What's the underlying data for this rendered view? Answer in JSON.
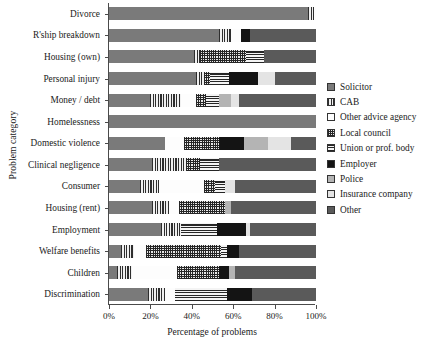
{
  "chart_data": {
    "type": "bar",
    "orientation": "horizontal",
    "stacked": true,
    "normalized": true,
    "title": "",
    "xlabel": "Percentage of problems",
    "ylabel": "Problem category",
    "xlim": [
      0,
      100
    ],
    "xticks": [
      "0%",
      "20%",
      "40%",
      "60%",
      "80%",
      "100%"
    ],
    "xtick_values": [
      0,
      20,
      40,
      60,
      80,
      100
    ],
    "grid": false,
    "legend_position": "right",
    "categories": [
      "Divorce",
      "R'ship breakdown",
      "Housing (own)",
      "Personal injury",
      "Money / debt",
      "Homelessness",
      "Domestic violence",
      "Clinical negligence",
      "Consumer",
      "Housing (rent)",
      "Employment",
      "Welfare benefits",
      "Children",
      "Discrimination"
    ],
    "series": [
      {
        "name": "Solicitor",
        "color": "#7a7a7a",
        "pattern": "solid-grey",
        "values": [
          96,
          53,
          41,
          42,
          20,
          100,
          27,
          21,
          15,
          21,
          25,
          6,
          4,
          19
        ]
      },
      {
        "name": "CAB",
        "color": "#2e2e2e",
        "pattern": "vertical-lines",
        "values": [
          3,
          6,
          3,
          4,
          15,
          0,
          0,
          16,
          9,
          8,
          10,
          6,
          7,
          8
        ]
      },
      {
        "name": "Other advice agency",
        "color": "#fdfdfd",
        "pattern": "white",
        "values": [
          1,
          5,
          0,
          0,
          7,
          0,
          9,
          0,
          22,
          5,
          0,
          6,
          22,
          5
        ]
      },
      {
        "name": "Local council",
        "color": "#262626",
        "pattern": "checker-dots",
        "values": [
          0,
          0,
          22,
          3,
          5,
          0,
          17,
          7,
          5,
          22,
          0,
          36,
          20,
          0
        ]
      },
      {
        "name": "Union or prof. body",
        "color": "#262626",
        "pattern": "horizontal-lines",
        "values": [
          0,
          0,
          9,
          9,
          6,
          0,
          0,
          9,
          5,
          0,
          17,
          3,
          0,
          25
        ]
      },
      {
        "name": "Employer",
        "color": "#141414",
        "pattern": "solid-black",
        "values": [
          0,
          4,
          0,
          14,
          0,
          0,
          12,
          0,
          0,
          0,
          14,
          6,
          5,
          12
        ]
      },
      {
        "name": "Police",
        "color": "#b4b4b4",
        "pattern": "solid-light-grey",
        "values": [
          0,
          0,
          0,
          0,
          6,
          0,
          12,
          0,
          0,
          3,
          0,
          0,
          3,
          0
        ]
      },
      {
        "name": "Insurance company",
        "color": "#e4e4e4",
        "pattern": "solid-pale",
        "values": [
          0,
          0,
          0,
          8,
          4,
          0,
          11,
          0,
          5,
          0,
          2,
          0,
          0,
          0
        ]
      },
      {
        "name": "Other",
        "color": "#5a5a5a",
        "pattern": "solid-dark-grey",
        "values": [
          0,
          32,
          25,
          20,
          37,
          0,
          12,
          47,
          39,
          41,
          32,
          37,
          39,
          31
        ]
      }
    ]
  }
}
